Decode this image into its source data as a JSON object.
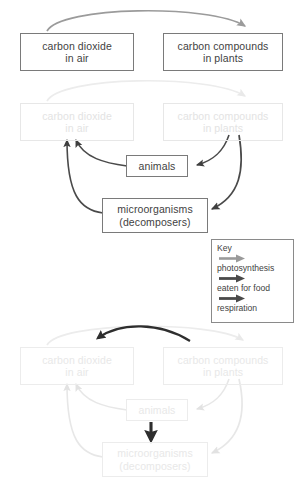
{
  "diagram": {
    "colors": {
      "dark_arrow": "#3f3f3f",
      "mid_arrow": "#8f8f8f",
      "box_border": "#7a7a7a",
      "faded_border": "#e7e7e7",
      "faded_text": "#e3e3e3",
      "text": "#3f3f3f"
    }
  },
  "nodes": {
    "carbon_dioxide": {
      "line1": "carbon dioxide",
      "line2": "in air"
    },
    "carbon_compounds": {
      "line1": "carbon compounds",
      "line2": "in plants"
    },
    "animals": {
      "line1": "animals"
    },
    "microorganisms": {
      "line1": "microorganisms",
      "line2": "(decomposers)"
    }
  },
  "key": {
    "title": "Key",
    "entries": [
      {
        "label": "photosynthesis",
        "icon": "arrow-right-icon",
        "color": "#9a9a9a"
      },
      {
        "label": "eaten for food",
        "icon": "arrow-right-icon",
        "color": "#4a4a4a"
      },
      {
        "label": "respiration",
        "icon": "arrow-right-icon",
        "color": "#4a4a4a"
      }
    ]
  },
  "panels": [
    {
      "name": "stage-1-photosynthesis",
      "active_process": "photosynthesis",
      "edges": [
        {
          "from": "carbon_dioxide",
          "to": "carbon_compounds",
          "process": "photosynthesis",
          "state": "active"
        }
      ]
    },
    {
      "name": "stage-2-eaten-for-food",
      "active_process": "eaten for food",
      "edges": [
        {
          "from": "carbon_dioxide",
          "to": "carbon_compounds",
          "process": "photosynthesis",
          "state": "faded"
        },
        {
          "from": "carbon_compounds",
          "to": "animals",
          "process": "eaten for food",
          "state": "active"
        },
        {
          "from": "carbon_compounds",
          "to": "microorganisms",
          "process": "eaten for food",
          "state": "active"
        },
        {
          "from": "animals",
          "to": "carbon_dioxide",
          "process": "respiration",
          "state": "active"
        },
        {
          "from": "microorganisms",
          "to": "carbon_dioxide",
          "process": "respiration",
          "state": "active"
        }
      ]
    },
    {
      "name": "stage-3-respiration",
      "active_process": "respiration",
      "edges": [
        {
          "from": "carbon_dioxide",
          "to": "carbon_compounds",
          "process": "photosynthesis",
          "state": "faded"
        },
        {
          "from": "carbon_compounds",
          "to": "carbon_dioxide",
          "process": "respiration",
          "state": "active"
        },
        {
          "from": "carbon_compounds",
          "to": "animals",
          "process": "eaten for food",
          "state": "faded"
        },
        {
          "from": "carbon_compounds",
          "to": "microorganisms",
          "process": "eaten for food",
          "state": "faded"
        },
        {
          "from": "animals",
          "to": "microorganisms",
          "process": "eaten for food",
          "state": "active"
        },
        {
          "from": "animals",
          "to": "carbon_dioxide",
          "process": "respiration",
          "state": "faded"
        },
        {
          "from": "microorganisms",
          "to": "carbon_dioxide",
          "process": "respiration",
          "state": "faded"
        }
      ]
    }
  ]
}
